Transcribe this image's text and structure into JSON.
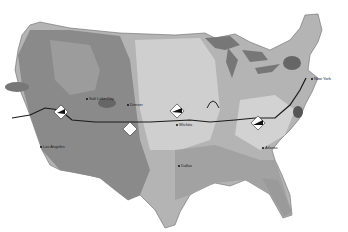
{
  "map": {
    "title": "United States route map",
    "colors": {
      "background": "#ffffff",
      "land_light": "#c8c8c8",
      "land_mid": "#a0a0a0",
      "land_dark": "#7e7e7e",
      "water": "#8c8c8c",
      "route": "#1a1a1a"
    },
    "cities": [
      {
        "name": "Salt Lake City",
        "x": 86,
        "y": 98
      },
      {
        "name": "Denver",
        "x": 127,
        "y": 104
      },
      {
        "name": "Los Angeles",
        "x": 40,
        "y": 146
      },
      {
        "name": "Wichita",
        "x": 176,
        "y": 124
      },
      {
        "name": "Dallas",
        "x": 178,
        "y": 165
      },
      {
        "name": "Atlanta",
        "x": 262,
        "y": 147
      },
      {
        "name": "New York",
        "x": 311,
        "y": 78
      }
    ],
    "landmark_icons": [
      "road-sign-icon",
      "landmark-icon",
      "arch-icon",
      "mountain-icon"
    ]
  }
}
